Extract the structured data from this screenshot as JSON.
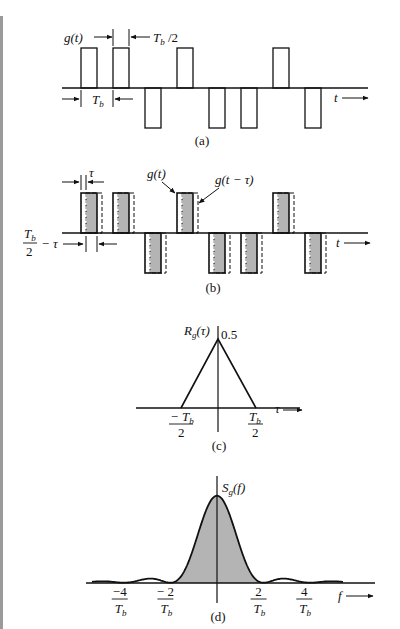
{
  "panels": {
    "a": {
      "caption": "(a)",
      "signal_label": "g(t)",
      "width_label_main": "T",
      "width_label_sub": "b",
      "width_label_suffix": " /2",
      "period_label_main": "T",
      "period_label_sub": "b",
      "axis_label": "t",
      "bits": [
        1,
        1,
        -1,
        1,
        -1,
        -1,
        1,
        -1
      ]
    },
    "b": {
      "caption": "(b)",
      "tau_label": "τ",
      "g_label": "g(t)",
      "g_shift_label": "g(t − τ)",
      "gap_label_num_main": "T",
      "gap_label_num_sub": "b",
      "gap_label_den": "2",
      "gap_label_suffix": "− τ",
      "axis_label": "t",
      "bits": [
        1,
        1,
        -1,
        1,
        -1,
        -1,
        1,
        -1
      ]
    },
    "c": {
      "caption": "(c)",
      "y_label_main": "R",
      "y_label_sub": "g",
      "y_label_suffix": "(τ)",
      "peak_label": "0.5",
      "left_tick_num": "− T",
      "left_tick_sub": "b",
      "left_tick_den": "2",
      "right_tick_num": "T",
      "right_tick_sub": "b",
      "right_tick_den": "2",
      "axis_label": "τ"
    },
    "d": {
      "caption": "(d)",
      "y_label_main": "S",
      "y_label_sub": "g",
      "y_label_suffix": "(f)",
      "ticks": [
        {
          "num": "−4",
          "den_main": "T",
          "den_sub": "b",
          "value": -4
        },
        {
          "num": "− 2",
          "den_main": "T",
          "den_sub": "b",
          "value": -2
        },
        {
          "num": "2",
          "den_main": "T",
          "den_sub": "b",
          "value": 2
        },
        {
          "num": "4",
          "den_main": "T",
          "den_sub": "b",
          "value": 4
        }
      ],
      "axis_label": "f"
    }
  },
  "colors": {
    "ink": "#111111",
    "fill": "#b4b4b4",
    "margin_bar": "#9a9a9a"
  }
}
